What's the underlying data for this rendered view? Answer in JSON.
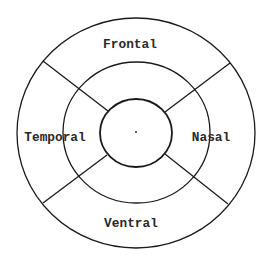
{
  "diagram": {
    "type": "concentric-sector-map",
    "stroke_color": "#1a1a1a",
    "text_color": "#2a2a2a",
    "background": "#ffffff",
    "center": {
      "x": 136,
      "y": 133
    },
    "circles": [
      {
        "name": "outer",
        "rx": 119,
        "ry": 115
      },
      {
        "name": "middle",
        "rx": 73.5,
        "ry": 71
      },
      {
        "name": "inner",
        "rx": 36,
        "ry": 34.5
      }
    ],
    "dividers": [
      {
        "name": "upper-left",
        "x1": 43,
        "y1": 61,
        "x2": 108,
        "y2": 111
      },
      {
        "name": "upper-right",
        "x1": 230,
        "y1": 63,
        "x2": 165,
        "y2": 112
      },
      {
        "name": "lower-left",
        "x1": 43,
        "y1": 203,
        "x2": 107,
        "y2": 155
      },
      {
        "name": "lower-right",
        "x1": 228,
        "y1": 204,
        "x2": 165,
        "y2": 154
      }
    ],
    "regions": {
      "frontal": {
        "label": "Frontal",
        "x": 130,
        "y": 48
      },
      "temporal": {
        "label": "Temporal",
        "x": 55,
        "y": 141
      },
      "nasal": {
        "label": "Nasal",
        "x": 211,
        "y": 141
      },
      "ventral": {
        "label": "Ventral",
        "x": 131,
        "y": 227
      }
    },
    "center_dot": {
      "x": 136,
      "y": 132
    }
  }
}
